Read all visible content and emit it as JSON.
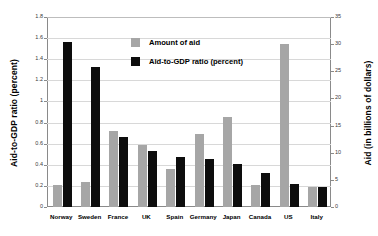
{
  "chart_data": {
    "type": "bar",
    "title": "",
    "subtitle": "",
    "xlabel": "",
    "ylabel": "Aid-to-GDP ratio (percent)",
    "y2label": "Aid (in billions of dollars)",
    "grid": true,
    "legend_position": "inside-top-center",
    "categories": [
      "Norway",
      "Sweden",
      "France",
      "UK",
      "Spain",
      "Germany",
      "Japan",
      "Canada",
      "US",
      "Italy"
    ],
    "ylim": [
      0,
      1.8
    ],
    "y2lim": [
      0,
      35
    ],
    "yticks": [
      "0",
      "0.2",
      "0.4",
      "0.6",
      "0.8",
      "1",
      "1.2",
      "1.4",
      "1.6",
      "1.8"
    ],
    "ytick_values": [
      0,
      0.2,
      0.4,
      0.6,
      0.8,
      1,
      1.2,
      1.4,
      1.6,
      1.8
    ],
    "y2ticks": [
      "0",
      "5",
      "10",
      "15",
      "20",
      "25",
      "30",
      "35"
    ],
    "y2tick_values": [
      0,
      5,
      10,
      15,
      20,
      25,
      30,
      35
    ],
    "series": [
      {
        "name": "Amount of aid",
        "axis": "right",
        "color": "#a6a6a6",
        "unit": "billions of dollars",
        "values": [
          4.1,
          4.6,
          14.0,
          11.5,
          7.0,
          13.4,
          16.5,
          4.1,
          30.0,
          3.7
        ]
      },
      {
        "name": "Aid-to-GDP ratio (percent)",
        "axis": "left",
        "color": "#0d0d0d",
        "unit": "percent",
        "values": [
          1.56,
          1.33,
          0.66,
          0.53,
          0.475,
          0.455,
          0.41,
          0.32,
          0.22,
          0.19
        ]
      }
    ]
  },
  "legend": {
    "items": [
      {
        "label": "Amount of aid",
        "swatch": "gray"
      },
      {
        "label": "Aid-to-GDP ratio (percent)",
        "swatch": "black"
      }
    ]
  }
}
